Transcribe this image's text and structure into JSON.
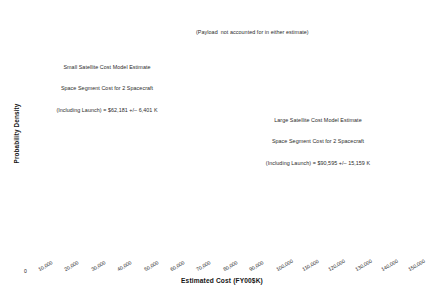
{
  "chart_data": {
    "type": "line",
    "title": "",
    "xlabel": "Estimated Cost (FY00$K)",
    "ylabel": "Probability Density",
    "xlim": [
      0,
      150000
    ],
    "ylim": [
      0,
      1
    ],
    "grid": false,
    "legend": "none",
    "xticks": [
      0,
      10000,
      20000,
      30000,
      40000,
      50000,
      60000,
      70000,
      80000,
      90000,
      100000,
      110000,
      120000,
      130000,
      140000,
      150000
    ],
    "xticklabels": [
      "0",
      "10,000",
      "20,000",
      "30,000",
      "40,000",
      "50,000",
      "60,000",
      "70,000",
      "80,000",
      "90,000",
      "100,000",
      "110,000",
      "120,000",
      "130,000",
      "140,000",
      "150,000"
    ],
    "yticks": [
      0.2,
      0.4,
      0.6,
      0.8
    ],
    "yticklabels": [
      "",
      "",
      "",
      ""
    ],
    "series": [
      {
        "name": "Small Satellite Cost Model Estimate",
        "distribution": "normal",
        "mean": 62181,
        "sigma": 6401,
        "peak_relative_height": 1.0,
        "color": "#3a3a3a"
      },
      {
        "name": "Large Satellite Cost Model Estimate",
        "distribution": "normal",
        "mean": 90595,
        "sigma": 15159,
        "peak_relative_height": 0.29,
        "color": "#3a3a3a"
      }
    ],
    "annotations": [
      {
        "id": "payload-note",
        "lines": [
          "(Payload  not accounted for in either estimate)"
        ]
      },
      {
        "id": "small-satellite-note",
        "lines": [
          "Small Satellite Cost Model Estimate",
          "Space Segment Cost for 2 Spacecraft",
          "(Including Launch) = $62,181 +/– 6,401 K"
        ]
      },
      {
        "id": "large-satellite-note",
        "lines": [
          "Large Satellite Cost Model Estimate",
          "Space Segment Cost for 2 Spacecraft",
          "(Including Launch) = $90,595 +/– 15,159 K"
        ]
      }
    ]
  }
}
